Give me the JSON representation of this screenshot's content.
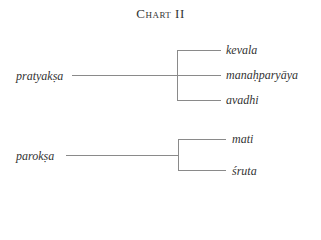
{
  "title": "Chart II",
  "groups": [
    {
      "root": "pratyakṣa",
      "branches": [
        "kevala",
        "manaḥparyāya",
        "avadhi"
      ]
    },
    {
      "root": "parokṣa",
      "branches": [
        "mati",
        "śruta"
      ]
    }
  ],
  "colors": {
    "line": "#8a8a8a",
    "text": "#333333"
  }
}
